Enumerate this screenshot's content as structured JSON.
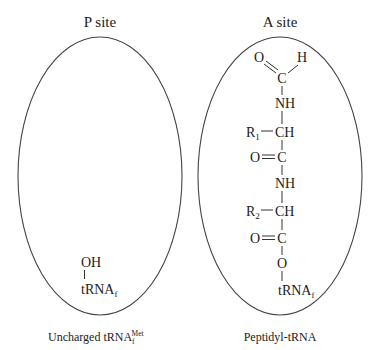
{
  "p_site": {
    "title": "P site",
    "oh": "OH",
    "trna": "tRNA",
    "trna_sub": "f",
    "caption": "Uncharged tRNA",
    "caption_sub": "f",
    "caption_sup": "Met"
  },
  "a_site": {
    "title": "A site",
    "formyl_o": "O",
    "formyl_h": "H",
    "formyl_c": "C",
    "nh1": "NH",
    "r1": "R",
    "r1_sub": "1",
    "ch1": "CH",
    "o2": "O",
    "c2": "C",
    "nh2": "NH",
    "r2": "R",
    "r2_sub": "2",
    "ch2": "CH",
    "o3": "O",
    "c3": "C",
    "o_ester": "O",
    "trna": "tRNA",
    "trna_sub": "f",
    "caption": "Peptidyl-tRNA"
  }
}
